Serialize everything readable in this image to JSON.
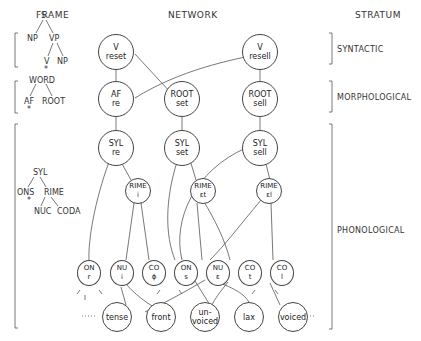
{
  "headers": {
    "frame": "FRAME",
    "network": "NETWORK",
    "stratum": "STRATUM"
  },
  "strata": {
    "syntactic": "SYNTACTIC",
    "morphological": "MORPHOLOGICAL",
    "phonological": "PHONOLOGICAL"
  },
  "frames": {
    "syntactic": {
      "s": "S",
      "np1": "NP",
      "vp": "VP",
      "v": "V",
      "np2": "NP",
      "star": "*"
    },
    "morphological": {
      "word": "WORD",
      "af": "AF",
      "root": "ROOT",
      "star": "*"
    },
    "phonological": {
      "syl": "SYL",
      "ons": "ONS",
      "rime": "RIME",
      "nuc": "NUC",
      "coda": "CODA",
      "star": "*"
    }
  },
  "nodes": {
    "v_reset": {
      "l1": "V",
      "l2": "reset"
    },
    "v_resell": {
      "l1": "V",
      "l2": "resell"
    },
    "af_re": {
      "l1": "AF",
      "l2": "re"
    },
    "root_set": {
      "l1": "ROOT",
      "l2": "set"
    },
    "root_sell": {
      "l1": "ROOT",
      "l2": "sell"
    },
    "syl_re": {
      "l1": "SYL",
      "l2": "re"
    },
    "syl_set": {
      "l1": "SYL",
      "l2": "set"
    },
    "syl_sell": {
      "l1": "SYL",
      "l2": "sell"
    },
    "rime_i": {
      "l1": "RIME",
      "l2": "i"
    },
    "rime_et": {
      "l1": "RIME",
      "l2": "ɛt"
    },
    "rime_el": {
      "l1": "RIME",
      "l2": "ɛl"
    },
    "on_r": {
      "l1": "ON",
      "l2": "r"
    },
    "nu_i": {
      "l1": "NU",
      "l2": "i"
    },
    "co_null": {
      "l1": "CO",
      "l2": "ϕ"
    },
    "on_s": {
      "l1": "ON",
      "l2": "s"
    },
    "nu_e": {
      "l1": "NU",
      "l2": "ɛ"
    },
    "co_t": {
      "l1": "CO",
      "l2": "t"
    },
    "co_l": {
      "l1": "CO",
      "l2": "l"
    },
    "tense": {
      "l1": "tense"
    },
    "front": {
      "l1": "front"
    },
    "unvoiced": {
      "l1": "un-",
      "l2": "voiced"
    },
    "lax": {
      "l1": "lax"
    },
    "voiced": {
      "l1": "voiced"
    }
  },
  "ellipsis": "......"
}
